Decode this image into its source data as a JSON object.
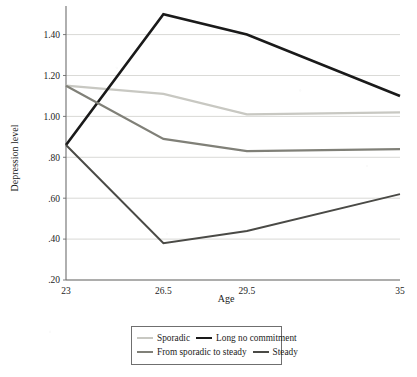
{
  "chart_data": {
    "type": "line",
    "title": "",
    "xlabel": "Age",
    "ylabel": "Depression level",
    "x": [
      23,
      26.5,
      29.5,
      35
    ],
    "xtick_labels": [
      "23",
      "26.5",
      "29.5",
      "35"
    ],
    "ytick_labels": [
      ".20",
      ".40",
      ".60",
      ".80",
      "1.00",
      "1.20",
      "1.40"
    ],
    "ytick_values": [
      0.2,
      0.4,
      0.6,
      0.8,
      1.0,
      1.2,
      1.4
    ],
    "ylim": [
      0.2,
      1.53
    ],
    "xlim": [
      23,
      35
    ],
    "grid": "horizontal",
    "legend_position": "bottom",
    "series": [
      {
        "name": "Sporadic",
        "color": "#c8c8c2",
        "width": 2.2,
        "values": [
          1.15,
          1.11,
          1.01,
          1.02
        ]
      },
      {
        "name": "Long no commitment",
        "color": "#1a1a1a",
        "width": 2.6,
        "values": [
          0.86,
          1.5,
          1.4,
          1.1
        ]
      },
      {
        "name": "From sporadic to steady",
        "color": "#808078",
        "width": 2.2,
        "values": [
          1.15,
          0.89,
          0.83,
          0.84
        ]
      },
      {
        "name": "Steady",
        "color": "#4a4a46",
        "width": 2.0,
        "values": [
          0.86,
          0.38,
          0.44,
          0.62
        ]
      }
    ]
  },
  "axes": {
    "y_title": "Depression level",
    "x_title": "Age"
  },
  "legend": {
    "row1": [
      {
        "label": "Sporadic",
        "color": "#c8c8c2",
        "width": 2.2
      },
      {
        "label": "Long no commitment",
        "color": "#1a1a1a",
        "width": 2.8
      }
    ],
    "row2": [
      {
        "label": "From sporadic to steady",
        "color": "#808078",
        "width": 2.3
      },
      {
        "label": "Steady",
        "color": "#4a4a46",
        "width": 2.3
      }
    ]
  },
  "colors": {
    "grid": "#c9c9c4",
    "axis": "#6e6e6e",
    "text": "#1c1c1c",
    "background": "#ffffff",
    "legend_border": "#6f6f6f"
  }
}
